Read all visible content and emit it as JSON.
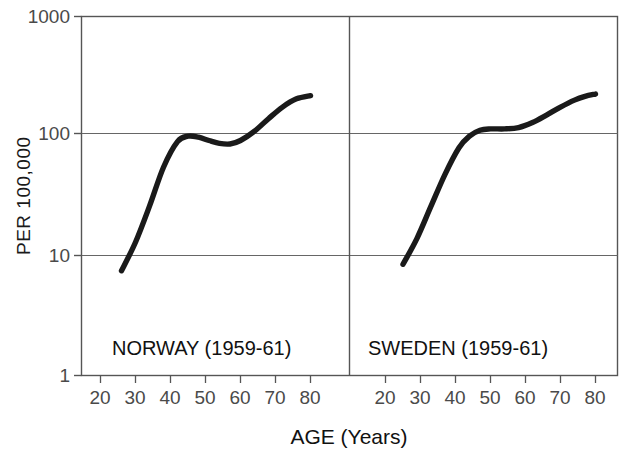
{
  "figure": {
    "background": "#ffffff",
    "line_color": "#1a1a1a",
    "axis_color": "#4a4a4a",
    "grid_color": "#8c8c8c"
  },
  "axes": {
    "ylabel": "PER 100,000",
    "xlabel": "AGE (Years)",
    "y_ticks": [
      "1000",
      "100",
      "10",
      "1"
    ],
    "x_ticks": [
      "20",
      "30",
      "40",
      "50",
      "60",
      "70",
      "80"
    ],
    "y_scale": "log",
    "y_range": [
      1,
      1000
    ],
    "x_range": [
      18,
      83
    ],
    "grid": "horizontal"
  },
  "panels": [
    {
      "label": "NORWAY (1959-61)"
    },
    {
      "label": "SWEDEN (1959-61)"
    }
  ],
  "chart_data": {
    "type": "line",
    "title": "",
    "subtitle": "",
    "xlabel": "AGE (Years)",
    "ylabel": "PER 100,000",
    "yscale": "log",
    "ylim": [
      1,
      1000
    ],
    "xlim": [
      18,
      83
    ],
    "grid": "horizontal gridlines at 10, 100 and frame at 1, 1000",
    "legend": "none (panel annotations used instead)",
    "panel_layout": "two side-by-side panels sharing one y-axis",
    "series": [
      {
        "name": "NORWAY (1959-61)",
        "panel": 0,
        "x": [
          26,
          30,
          34,
          38,
          42,
          45,
          48,
          51,
          54,
          57,
          60,
          64,
          68,
          72,
          76,
          80
        ],
        "y": [
          7.5,
          13,
          26,
          55,
          90,
          100,
          98,
          92,
          87,
          86,
          92,
          110,
          140,
          175,
          205,
          218
        ]
      },
      {
        "name": "SWEDEN (1959-61)",
        "panel": 1,
        "x": [
          25,
          29,
          33,
          37,
          41,
          44,
          47,
          50,
          54,
          58,
          62,
          66,
          70,
          74,
          77,
          80
        ],
        "y": [
          8.5,
          14,
          26,
          48,
          80,
          100,
          112,
          115,
          115,
          118,
          130,
          150,
          175,
          200,
          215,
          225
        ]
      }
    ]
  }
}
